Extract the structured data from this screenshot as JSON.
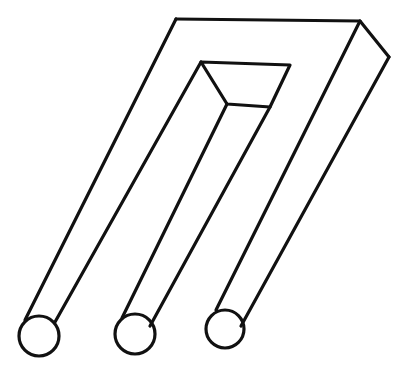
{
  "figure": {
    "stroke_color": "#111111",
    "background_color": "#ffffff",
    "prongs": 3
  }
}
